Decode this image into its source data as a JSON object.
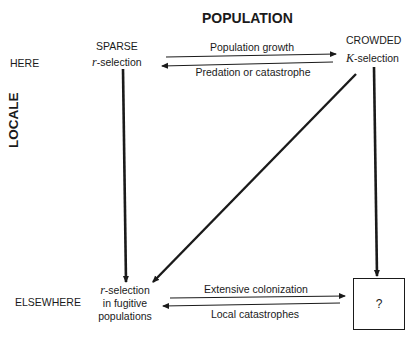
{
  "title": "POPULATION",
  "axis_label": "LOCALE",
  "rows": {
    "here": "HERE",
    "elsewhere": "ELSEWHERE"
  },
  "nodes": {
    "sparse": {
      "heading": "SPARSE",
      "symbol": "r",
      "label": "-selection"
    },
    "crowded": {
      "heading": "CROWDED",
      "symbol": "K",
      "label": "-selection"
    },
    "fugitive": {
      "symbol": "r",
      "line1": "-selection",
      "line2": "in fugitive",
      "line3": "populations"
    },
    "unknown": {
      "label": "?"
    }
  },
  "edges": {
    "growth": "Population growth",
    "predation": "Predation or catastrophe",
    "colonization": "Extensive colonization",
    "local_catastrophes": "Local catastrophes"
  }
}
